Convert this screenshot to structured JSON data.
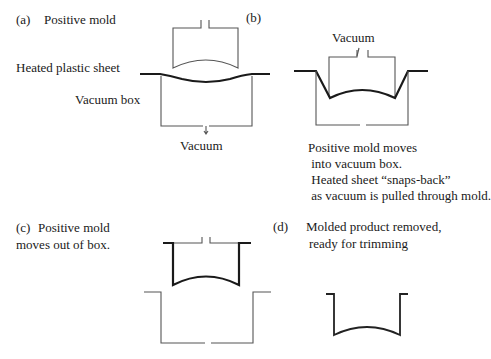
{
  "panels": {
    "a": {
      "tag": "(a)",
      "title": "Positive mold",
      "sheet_label": "Heated plastic sheet",
      "box_label": "Vacuum box",
      "vacuum_label": "Vacuum"
    },
    "b": {
      "tag": "(b)",
      "vacuum_label": "Vacuum",
      "caption_lines": [
        "Positive mold moves",
        " into vacuum box.",
        " Heated sheet “snaps-back”",
        " as vacuum is pulled through mold."
      ]
    },
    "c": {
      "tag": "(c)",
      "caption_lines": [
        "Positive mold",
        "moves out of box."
      ]
    },
    "d": {
      "tag": "(d)",
      "caption_lines": [
        "Molded product removed,",
        "ready for trimming"
      ]
    }
  }
}
